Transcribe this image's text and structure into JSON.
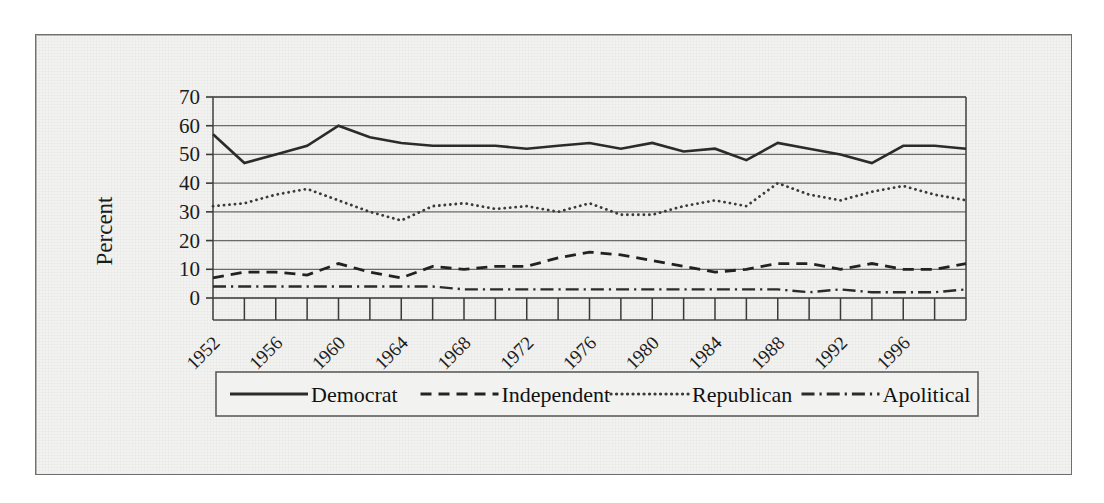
{
  "figure": {
    "background_color": "#f2f2f0",
    "frame_color": "#6f6f6f",
    "ink_color": "#1b1b1b",
    "gridline_color": "#6a6a6a"
  },
  "chart_data": {
    "type": "line",
    "title": "",
    "subtitle": "",
    "xlabel": "",
    "ylabel": "Percent",
    "xlim": [
      1952,
      2000
    ],
    "ylim": [
      0,
      70
    ],
    "ytick_values": [
      0,
      10,
      20,
      30,
      40,
      50,
      60,
      70
    ],
    "ytick_labels": [
      "0",
      "10",
      "20",
      "30",
      "40",
      "50",
      "60",
      "70"
    ],
    "xtick_values": [
      1952,
      1954,
      1956,
      1958,
      1960,
      1962,
      1964,
      1966,
      1968,
      1970,
      1972,
      1974,
      1976,
      1978,
      1980,
      1982,
      1984,
      1986,
      1988,
      1990,
      1992,
      1994,
      1996,
      1998,
      2000
    ],
    "xtick_labels": [
      "1952",
      "",
      "1956",
      "",
      "1960",
      "",
      "1964",
      "",
      "1968",
      "",
      "1972",
      "",
      "1976",
      "",
      "1980",
      "",
      "1984",
      "",
      "1988",
      "",
      "1992",
      "",
      "1996",
      "",
      ""
    ],
    "xtick_label_rotation": -45,
    "grid": true,
    "grid_axis": "y",
    "legend_position": "below",
    "x": [
      1952,
      1954,
      1956,
      1958,
      1960,
      1962,
      1964,
      1966,
      1968,
      1970,
      1972,
      1974,
      1976,
      1978,
      1980,
      1982,
      1984,
      1986,
      1988,
      1990,
      1992,
      1994,
      1996,
      1998,
      2000
    ],
    "series": [
      {
        "name": "Democrat",
        "line_style": "solid",
        "color": "#2b2b2b",
        "line_width": 2.6,
        "values": [
          57,
          47,
          50,
          53,
          60,
          56,
          54,
          53,
          53,
          53,
          52,
          53,
          54,
          52,
          54,
          51,
          52,
          48,
          54,
          52,
          50,
          47,
          53,
          53,
          52
        ]
      },
      {
        "name": "Independent",
        "line_style": "dashed",
        "color": "#222222",
        "line_width": 2.8,
        "values": [
          7,
          9,
          9,
          8,
          12,
          9,
          7,
          11,
          10,
          11,
          11,
          14,
          16,
          15,
          13,
          11,
          9,
          10,
          12,
          12,
          10,
          12,
          10,
          10,
          12
        ]
      },
      {
        "name": "Republican",
        "line_style": "dotted",
        "color": "#3a3a3a",
        "line_width": 2.8,
        "values": [
          32,
          33,
          36,
          38,
          34,
          30,
          27,
          32,
          33,
          31,
          32,
          30,
          33,
          29,
          29,
          32,
          34,
          32,
          40,
          36,
          34,
          37,
          39,
          36,
          34
        ]
      },
      {
        "name": "Apolitical",
        "line_style": "dashdot",
        "color": "#2b2b2b",
        "line_width": 2.4,
        "values": [
          4,
          4,
          4,
          4,
          4,
          4,
          4,
          4,
          3,
          3,
          3,
          3,
          3,
          3,
          3,
          3,
          3,
          3,
          3,
          2,
          3,
          2,
          2,
          2,
          3
        ]
      }
    ]
  },
  "legend": {
    "entries": [
      {
        "label": "Democrat",
        "style": "solid"
      },
      {
        "label": "Independent",
        "style": "dashed"
      },
      {
        "label": "Republican",
        "style": "dotted"
      },
      {
        "label": "Apolitical",
        "style": "dashdot"
      }
    ]
  }
}
